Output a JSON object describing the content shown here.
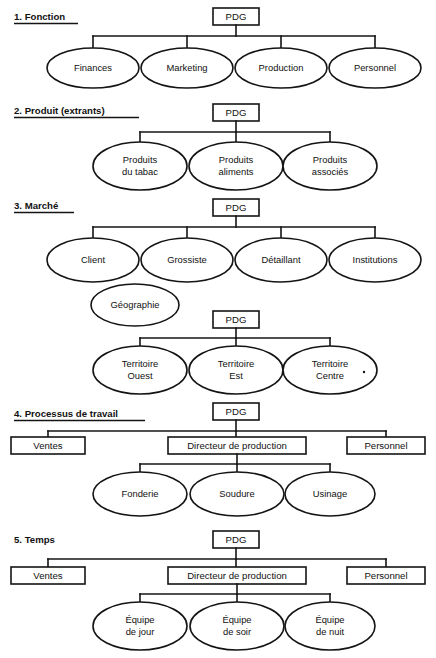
{
  "document": {
    "title": "Types de départementalisation",
    "language": "fr"
  },
  "style": {
    "stroke_color": "#141414",
    "text_color": "#111111",
    "background_color": "#ffffff",
    "node_fill": "#ffffff"
  },
  "sections": [
    {
      "id": "fonction",
      "heading": "1. Fonction",
      "root": {
        "label": "PDG",
        "shape": "rect"
      },
      "children": [
        {
          "label": "Finances",
          "shape": "ellipse"
        },
        {
          "label": "Marketing",
          "shape": "ellipse"
        },
        {
          "label": "Production",
          "shape": "ellipse"
        },
        {
          "label": "Personnel",
          "shape": "ellipse"
        }
      ]
    },
    {
      "id": "produit",
      "heading": "2. Produit (extrants)",
      "root": {
        "label": "PDG",
        "shape": "rect"
      },
      "children": [
        {
          "label_line1": "Produits",
          "label_line2": "du tabac",
          "shape": "ellipse"
        },
        {
          "label_line1": "Produits",
          "label_line2": "aliments",
          "shape": "ellipse"
        },
        {
          "label_line1": "Produits",
          "label_line2": "associés",
          "shape": "ellipse"
        }
      ]
    },
    {
      "id": "marche",
      "heading": "3. Marché",
      "root": {
        "label": "PDG",
        "shape": "rect"
      },
      "children": [
        {
          "label": "Client",
          "shape": "ellipse"
        },
        {
          "label": "Grossiste",
          "shape": "ellipse"
        },
        {
          "label": "Détaillant",
          "shape": "ellipse"
        },
        {
          "label": "Institutions",
          "shape": "ellipse"
        }
      ],
      "aside": {
        "label": "Géographie",
        "shape": "ellipse"
      },
      "sub_root": {
        "label": "PDG",
        "shape": "rect"
      },
      "sub_children": [
        {
          "label_line1": "Territoire",
          "label_line2": "Ouest",
          "shape": "ellipse"
        },
        {
          "label_line1": "Territoire",
          "label_line2": "Est",
          "shape": "ellipse"
        },
        {
          "label_line1": "Territoire",
          "label_line2": "Centre",
          "shape": "ellipse"
        }
      ]
    },
    {
      "id": "processus",
      "heading": "4. Processus de travail",
      "root": {
        "label": "PDG",
        "shape": "rect"
      },
      "children": [
        {
          "label": "Ventes",
          "shape": "rect"
        },
        {
          "label": "Directeur de production",
          "shape": "rect"
        },
        {
          "label": "Personnel",
          "shape": "rect"
        }
      ],
      "sub_children": [
        {
          "label": "Fonderie",
          "shape": "ellipse"
        },
        {
          "label": "Soudure",
          "shape": "ellipse"
        },
        {
          "label": "Usinage",
          "shape": "ellipse"
        }
      ]
    },
    {
      "id": "temps",
      "heading": "5. Temps",
      "root": {
        "label": "PDG",
        "shape": "rect"
      },
      "children": [
        {
          "label": "Ventes",
          "shape": "rect"
        },
        {
          "label": "Directeur de production",
          "shape": "rect"
        },
        {
          "label": "Personnel",
          "shape": "rect"
        }
      ],
      "sub_children": [
        {
          "label_line1": "Équipe",
          "label_line2": "de jour",
          "shape": "ellipse"
        },
        {
          "label_line1": "Équipe",
          "label_line2": "de soir",
          "shape": "ellipse"
        },
        {
          "label_line1": "Équipe",
          "label_line2": "de nuit",
          "shape": "ellipse"
        }
      ]
    }
  ]
}
